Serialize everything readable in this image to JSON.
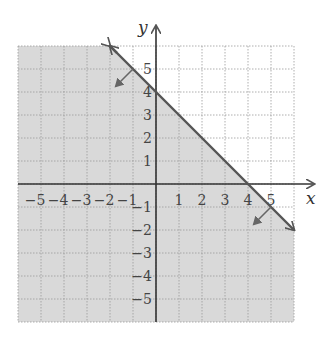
{
  "chart_data": {
    "type": "line",
    "title": "",
    "xlabel": "x",
    "ylabel": "y",
    "xlim": [
      -6,
      6
    ],
    "ylim": [
      -6,
      6
    ],
    "grid": true,
    "x_ticks": [
      -5,
      -4,
      -3,
      -2,
      -1,
      1,
      2,
      3,
      4,
      5
    ],
    "y_ticks": [
      5,
      4,
      3,
      2,
      1,
      -1,
      -2,
      -3,
      -4,
      -5
    ],
    "series": [
      {
        "name": "boundary line y = -x + 4",
        "style": "solid",
        "x": [
          -2,
          6
        ],
        "y": [
          6,
          -2
        ],
        "slope": -1,
        "intercept": 4
      }
    ],
    "shaded_region": "below line (y ≤ -x + 4)",
    "annotations": [
      {
        "type": "arrow",
        "from": [
          -1,
          5
        ],
        "to": [
          -2,
          4
        ],
        "meaning": "shading direction"
      },
      {
        "type": "arrow",
        "from": [
          5,
          -1
        ],
        "to": [
          4,
          -2
        ],
        "meaning": "shading direction"
      }
    ]
  },
  "labels": {
    "x_axis": "x",
    "y_axis": "y"
  },
  "colors": {
    "shade": "#d9d9d9",
    "line": "#555555",
    "grid": "#9a9a9a",
    "axis": "#333333"
  }
}
